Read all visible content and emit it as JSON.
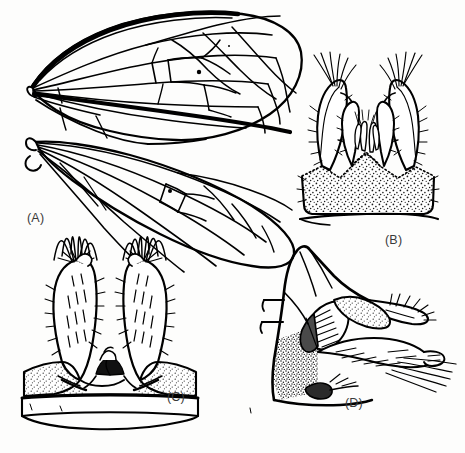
{
  "figure": {
    "kind": "scientific-illustration-plate",
    "style": "black-and-white pen-and-ink line drawing with stipple shading",
    "background_color": "#fdfdfc",
    "ink_color": "#000000",
    "label_color": "#3a3a3a",
    "shade_fill_color": "#4a4a4a",
    "width": 465,
    "height": 453
  },
  "panels": [
    {
      "id": "A",
      "label": "(A)",
      "label_position": {
        "x": 27,
        "y": 211
      },
      "content": "wings",
      "description": "Two overlapping membranous wings shown in full, upper wing above and lower wing below, with complete venation, cross-veins, closed discal cell and two small dark stigma spots.",
      "bounds": {
        "x": 20,
        "y": 10,
        "width": 290,
        "height": 250
      },
      "features": [
        "thickened dark costal margin on upper wing",
        "thickened dark anal/basal vein streak",
        "closed discal cell with cross-veins",
        "two small dark pterostigma dots",
        "rounded basal lobe (alula) on lower wing"
      ],
      "stigma_spots": 2
    },
    {
      "id": "B",
      "label": "(B)",
      "label_position": {
        "x": 385,
        "y": 233
      },
      "content": "male genitalia, dorsal view",
      "description": "Hypopygium in dorsal aspect: stippled trapezoidal tergite base, paired elongate gonostyli curving inward, inner pointed appendages and a central cluster of small digitiform lobes, with tufts of long setae on the outer apices.",
      "bounds": {
        "x": 290,
        "y": 65,
        "width": 150,
        "height": 165
      },
      "features": [
        "stippled tergite plate",
        "paired outer gonostyli with apical seta tufts",
        "paired inner curved appendages",
        "median cluster of small lobes",
        "fine marginal setae"
      ]
    },
    {
      "id": "C",
      "label": "(C)",
      "label_position": {
        "x": 167,
        "y": 390
      },
      "content": "male genitalia, ventral view",
      "description": "Hypopygium in ventral aspect: two broad setose gonocoxites diverging upward with dense apical seta brushes, a small dark median sclerite between them, stippled lateral lobes and a basal sternite band below.",
      "bounds": {
        "x": 15,
        "y": 250,
        "width": 190,
        "height": 190
      },
      "features": [
        "paired broad setose gonocoxites",
        "dense dark apical seta brushes",
        "dark median sclerite",
        "stippled basal lateral plates",
        "basal sternite band"
      ]
    },
    {
      "id": "D",
      "label": "(D)",
      "label_position": {
        "x": 345,
        "y": 396
      },
      "content": "male genitalia, lateral view",
      "description": "Hypopygium in lateral aspect: segment margins at left, stippled basal region, an elongate striated lobe with a dark shaded wedge (aedeagus), and an elongate posterior process bearing long trailing setae.",
      "bounds": {
        "x": 240,
        "y": 250,
        "width": 215,
        "height": 180
      },
      "features": [
        "segmental outline at anterior margin",
        "dark shaded aedeagal wedge",
        "ladder-striated lobe",
        "stippled basal region",
        "long trailing apical setae"
      ]
    }
  ]
}
